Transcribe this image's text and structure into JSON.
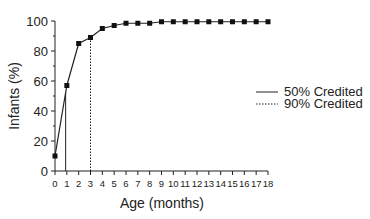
{
  "chart_data": {
    "type": "line",
    "title": "",
    "xlabel": "Age (months)",
    "ylabel": "Infants (%)",
    "xlim": [
      0,
      18
    ],
    "ylim": [
      0,
      100
    ],
    "x_ticks": [
      0,
      1,
      2,
      3,
      4,
      5,
      6,
      7,
      8,
      9,
      10,
      11,
      12,
      13,
      14,
      15,
      16,
      17,
      18
    ],
    "y_ticks": [
      0,
      20,
      40,
      60,
      80,
      100
    ],
    "grid": false,
    "legend_position": "right",
    "series": [
      {
        "name": "Infants credited",
        "x": [
          0,
          1,
          2,
          3,
          4,
          5,
          6,
          7,
          8,
          9,
          10,
          11,
          12,
          13,
          14,
          15,
          16,
          17,
          18
        ],
        "values": [
          10,
          57,
          85,
          89,
          95,
          97,
          98.5,
          98.5,
          98.5,
          99.5,
          99.5,
          99.5,
          99.5,
          99.5,
          99.5,
          99.5,
          99.5,
          99.5,
          99.5
        ],
        "marker": "square",
        "line": "solid"
      }
    ],
    "reference_lines": [
      {
        "label": "50% Credited",
        "x": 0.9,
        "style": "solid"
      },
      {
        "label": "90% Credited",
        "x": 3,
        "style": "dotted"
      }
    ],
    "legend": [
      "50% Credited",
      "90% Credited"
    ]
  }
}
